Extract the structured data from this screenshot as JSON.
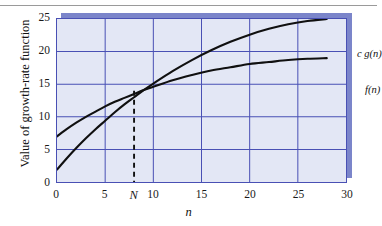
{
  "figure": {
    "background_color": "#ffffff",
    "plot_background_color": "#e3e7f5",
    "grid_color": "#4950b4",
    "shadow_color": "#7b85ca",
    "curve_color": "#101010",
    "top_rule_color": "#9a9a9a"
  },
  "chart_data": {
    "type": "line",
    "title": "",
    "xlabel": "n",
    "ylabel": "Value of growth-rate function",
    "xlim": [
      0,
      30
    ],
    "ylim": [
      0,
      25
    ],
    "grid": true,
    "legend_position": "inline-right",
    "x_tick_labels": [
      "0",
      "5",
      "N",
      "10",
      "15",
      "20",
      "25",
      "30"
    ],
    "x_tick_values": [
      0,
      5,
      8,
      10,
      15,
      20,
      25,
      30
    ],
    "y_tick_labels": [
      "0",
      "5",
      "10",
      "15",
      "20",
      "25"
    ],
    "y_tick_values": [
      0,
      5,
      10,
      15,
      20,
      25
    ],
    "series": [
      {
        "name": "c g(n)",
        "label": "c g(n)",
        "x": [
          0,
          1,
          2,
          3,
          4,
          5,
          6,
          7,
          8,
          9,
          10,
          12,
          14,
          16,
          18,
          20,
          22,
          24,
          26,
          28
        ],
        "values": [
          1.9,
          3.6,
          5.2,
          6.7,
          8.1,
          9.4,
          10.7,
          11.9,
          13.0,
          14.1,
          15.1,
          17.0,
          18.7,
          20.2,
          21.5,
          22.6,
          23.5,
          24.2,
          24.7,
          25.0
        ]
      },
      {
        "name": "f(n)",
        "label": "f(n)",
        "x": [
          0,
          1,
          2,
          3,
          4,
          5,
          6,
          7,
          8,
          9,
          10,
          12,
          14,
          16,
          18,
          20,
          22,
          24,
          26,
          28
        ],
        "values": [
          7.0,
          8.1,
          9.1,
          10.0,
          10.8,
          11.6,
          12.3,
          12.9,
          13.5,
          14.1,
          14.6,
          15.6,
          16.4,
          17.1,
          17.6,
          18.1,
          18.4,
          18.7,
          18.9,
          19.0
        ]
      }
    ],
    "annotations": [
      {
        "name": "threshold-marker",
        "label": "N",
        "x": 8,
        "y": 14.0,
        "style": "dashed-vertical-drop-line",
        "description": "Dashed vertical line from the curve crossing point down to the n axis at n = N"
      }
    ]
  }
}
